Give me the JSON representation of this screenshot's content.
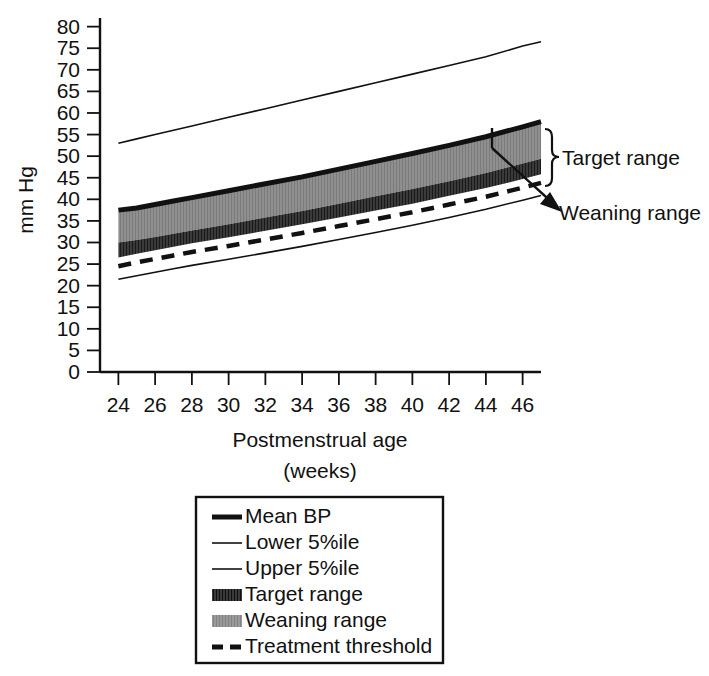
{
  "chart_data": {
    "type": "area",
    "title": "",
    "xlabel": "Postmenstrual age",
    "xlabel_sub": "(weeks)",
    "ylabel": "mm Hg",
    "xlim": [
      23,
      47
    ],
    "ylim": [
      0,
      82
    ],
    "xticks": [
      24,
      26,
      28,
      30,
      32,
      34,
      36,
      38,
      40,
      42,
      44,
      46
    ],
    "yticks": [
      0,
      5,
      10,
      15,
      20,
      25,
      30,
      35,
      40,
      45,
      50,
      55,
      60,
      65,
      70,
      75,
      80
    ],
    "grid": false,
    "legend_position": "below-plot",
    "x": [
      24,
      25,
      26,
      27,
      28,
      30,
      32,
      34,
      36,
      38,
      40,
      42,
      44,
      46,
      47
    ],
    "series": [
      {
        "name": "Upper 5%ile",
        "style": "thin-line",
        "color": "#111111",
        "values": [
          53.0,
          54.0,
          55.0,
          56.0,
          57.0,
          59.0,
          61.0,
          63.0,
          65.0,
          67.0,
          69.0,
          71.0,
          73.0,
          75.5,
          76.5
        ]
      },
      {
        "name": "Mean BP",
        "style": "thick-line",
        "color": "#111111",
        "values": [
          37.5,
          38.0,
          38.8,
          39.6,
          40.4,
          42.0,
          43.6,
          45.2,
          47.0,
          48.8,
          50.6,
          52.5,
          54.5,
          56.8,
          58.0
        ]
      },
      {
        "name": "Weaning range",
        "style": "band",
        "color": "#8a8a8a",
        "upper": [
          37.0,
          37.7,
          38.5,
          39.3,
          40.1,
          41.7,
          43.3,
          44.9,
          46.7,
          48.5,
          50.3,
          52.2,
          54.2,
          56.5,
          57.7
        ],
        "lower": [
          30.0,
          30.6,
          31.3,
          32.0,
          32.8,
          34.2,
          35.8,
          37.3,
          39.0,
          40.7,
          42.4,
          44.2,
          46.1,
          48.3,
          49.4
        ]
      },
      {
        "name": "Target range",
        "style": "band-hatched",
        "color": "#3a3a3a",
        "upper": [
          30.0,
          30.6,
          31.3,
          32.0,
          32.8,
          34.2,
          35.8,
          37.3,
          39.0,
          40.7,
          42.4,
          44.2,
          46.1,
          48.3,
          49.4
        ],
        "lower": [
          26.5,
          27.4,
          28.2,
          29.0,
          29.8,
          31.2,
          32.7,
          34.2,
          35.8,
          37.4,
          39.0,
          40.8,
          42.6,
          44.7,
          45.8
        ]
      },
      {
        "name": "Treatment threshold",
        "style": "dashed-line",
        "color": "#111111",
        "values": [
          24.5,
          25.4,
          26.2,
          27.0,
          27.8,
          29.2,
          30.7,
          32.2,
          33.8,
          35.4,
          37.0,
          38.8,
          40.6,
          42.7,
          43.8
        ]
      },
      {
        "name": "Lower 5%ile",
        "style": "thin-line",
        "color": "#111111",
        "values": [
          21.5,
          22.3,
          23.1,
          23.9,
          24.7,
          26.1,
          27.6,
          29.1,
          30.7,
          32.3,
          34.0,
          35.8,
          37.7,
          39.8,
          40.9
        ]
      }
    ],
    "annotations": [
      {
        "name": "target-range-annotation",
        "text": "Target range",
        "marker": "curly-brace"
      },
      {
        "name": "weaning-range-annotation",
        "text": "Weaning range",
        "marker": "arrow"
      }
    ],
    "legend": [
      {
        "label": "Mean BP",
        "swatch": "thick-line"
      },
      {
        "label": "Lower 5%ile",
        "swatch": "thin-line"
      },
      {
        "label": "Upper 5%ile",
        "swatch": "thin-line"
      },
      {
        "label": "Target range",
        "swatch": "dark-hatch-swatch"
      },
      {
        "label": "Weaning range",
        "swatch": "light-grey-swatch"
      },
      {
        "label": "Treatment threshold",
        "swatch": "dashed-line"
      }
    ]
  }
}
